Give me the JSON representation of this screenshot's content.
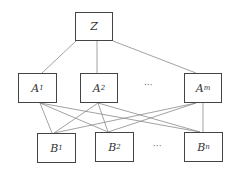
{
  "diagram": {
    "root": {
      "label": "Z",
      "x": 75,
      "y": 12,
      "w": 38,
      "h": 29
    },
    "level_a": [
      {
        "label": "A",
        "sub": "1",
        "x": 18,
        "y": 73,
        "w": 39,
        "h": 30
      },
      {
        "label": "A",
        "sub": "2",
        "x": 80,
        "y": 73,
        "w": 38,
        "h": 30
      },
      {
        "label": "A",
        "sub": "m",
        "x": 184,
        "y": 73,
        "w": 38,
        "h": 30
      }
    ],
    "level_b": [
      {
        "label": "B",
        "sub": "1",
        "x": 37,
        "y": 133,
        "w": 39,
        "h": 30
      },
      {
        "label": "B",
        "sub": "2",
        "x": 95,
        "y": 132,
        "w": 39,
        "h": 30
      },
      {
        "label": "B",
        "sub": "n",
        "x": 184,
        "y": 132,
        "w": 39,
        "h": 30
      }
    ],
    "ellipsis_a": "···",
    "ellipsis_b": "···",
    "edge_color": "#888888"
  }
}
